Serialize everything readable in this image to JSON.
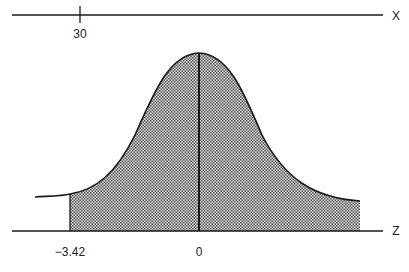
{
  "x_axis": {
    "label": "X",
    "tick_label": "30",
    "tick_x": 80
  },
  "z_axis": {
    "label": "Z",
    "tick_labels": [
      "−3.42",
      "0"
    ]
  },
  "curve": {
    "type": "normal-distribution",
    "shaded_from": "-3.42",
    "shaded_to": "right-tail",
    "center": "0"
  },
  "colors": {
    "line": "#1a1a1a",
    "shade_fg": "#555555",
    "shade_bg": "#d8d8d8"
  }
}
